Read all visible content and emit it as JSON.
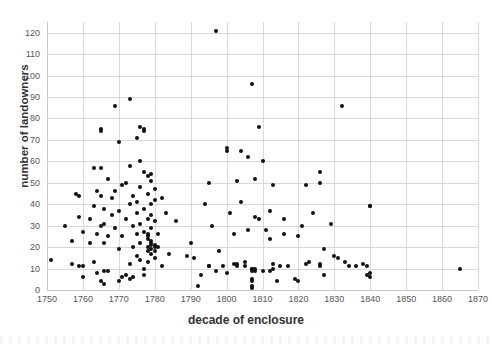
{
  "chart_data": {
    "type": "scatter",
    "title": "",
    "xlabel": "decade of enclosure",
    "ylabel": "number of landowners",
    "xlim": [
      1750,
      1870
    ],
    "ylim": [
      0,
      125
    ],
    "xticks": [
      1750,
      1760,
      1770,
      1780,
      1790,
      1800,
      1810,
      1820,
      1830,
      1840,
      1850,
      1860,
      1870
    ],
    "yticks": [
      0,
      10,
      20,
      30,
      40,
      50,
      60,
      70,
      80,
      90,
      100,
      110,
      120
    ],
    "grid": true,
    "legend": "none",
    "marker": "filled-circle",
    "marker_color": "#111111",
    "grid_color": "#d9d9d9",
    "points": [
      [
        1751,
        14
      ],
      [
        1755,
        30
      ],
      [
        1757,
        23
      ],
      [
        1757,
        12
      ],
      [
        1758,
        45
      ],
      [
        1759,
        44
      ],
      [
        1759,
        34
      ],
      [
        1759,
        11
      ],
      [
        1760,
        6
      ],
      [
        1760,
        27
      ],
      [
        1760,
        11
      ],
      [
        1762,
        33
      ],
      [
        1762,
        22
      ],
      [
        1763,
        57
      ],
      [
        1763,
        13
      ],
      [
        1763,
        39
      ],
      [
        1764,
        26
      ],
      [
        1764,
        8
      ],
      [
        1764,
        46
      ],
      [
        1765,
        74
      ],
      [
        1765,
        75
      ],
      [
        1765,
        44
      ],
      [
        1765,
        30
      ],
      [
        1765,
        57
      ],
      [
        1765,
        4
      ],
      [
        1766,
        3
      ],
      [
        1766,
        38
      ],
      [
        1766,
        9
      ],
      [
        1766,
        31
      ],
      [
        1766,
        22
      ],
      [
        1767,
        9
      ],
      [
        1767,
        25
      ],
      [
        1767,
        52
      ],
      [
        1768,
        35
      ],
      [
        1768,
        43
      ],
      [
        1769,
        29
      ],
      [
        1769,
        46
      ],
      [
        1769,
        86
      ],
      [
        1770,
        69
      ],
      [
        1770,
        4
      ],
      [
        1770,
        19
      ],
      [
        1770,
        37
      ],
      [
        1771,
        6
      ],
      [
        1771,
        49
      ],
      [
        1771,
        25
      ],
      [
        1772,
        50
      ],
      [
        1772,
        33
      ],
      [
        1772,
        7
      ],
      [
        1773,
        89
      ],
      [
        1773,
        58
      ],
      [
        1773,
        40
      ],
      [
        1773,
        12
      ],
      [
        1773,
        5
      ],
      [
        1774,
        30
      ],
      [
        1774,
        44
      ],
      [
        1774,
        6
      ],
      [
        1774,
        20
      ],
      [
        1775,
        71
      ],
      [
        1775,
        41
      ],
      [
        1775,
        26
      ],
      [
        1775,
        36
      ],
      [
        1775,
        16
      ],
      [
        1776,
        76
      ],
      [
        1776,
        60
      ],
      [
        1776,
        48
      ],
      [
        1776,
        22
      ],
      [
        1776,
        14
      ],
      [
        1776,
        31
      ],
      [
        1777,
        74
      ],
      [
        1777,
        75
      ],
      [
        1777,
        55
      ],
      [
        1777,
        38
      ],
      [
        1777,
        27
      ],
      [
        1777,
        10
      ],
      [
        1777,
        7
      ],
      [
        1778,
        53
      ],
      [
        1778,
        45
      ],
      [
        1778,
        33
      ],
      [
        1778,
        24
      ],
      [
        1778,
        25
      ],
      [
        1778,
        26
      ],
      [
        1778,
        20
      ],
      [
        1778,
        18
      ],
      [
        1778,
        13
      ],
      [
        1779,
        54
      ],
      [
        1779,
        51
      ],
      [
        1779,
        40
      ],
      [
        1779,
        35
      ],
      [
        1779,
        23
      ],
      [
        1779,
        21
      ],
      [
        1779,
        22
      ],
      [
        1779,
        19
      ],
      [
        1779,
        17
      ],
      [
        1779,
        29
      ],
      [
        1780,
        47
      ],
      [
        1780,
        42
      ],
      [
        1780,
        32
      ],
      [
        1780,
        21
      ],
      [
        1780,
        20
      ],
      [
        1780,
        18
      ],
      [
        1780,
        15
      ],
      [
        1781,
        26
      ],
      [
        1781,
        20
      ],
      [
        1782,
        11
      ],
      [
        1782,
        43
      ],
      [
        1783,
        36
      ],
      [
        1784,
        17
      ],
      [
        1786,
        32
      ],
      [
        1789,
        16
      ],
      [
        1790,
        22
      ],
      [
        1791,
        15
      ],
      [
        1792,
        2
      ],
      [
        1793,
        7
      ],
      [
        1794,
        40
      ],
      [
        1795,
        11
      ],
      [
        1795,
        11
      ],
      [
        1795,
        50
      ],
      [
        1796,
        30
      ],
      [
        1797,
        121
      ],
      [
        1797,
        9
      ],
      [
        1798,
        18
      ],
      [
        1799,
        11
      ],
      [
        1800,
        66
      ],
      [
        1800,
        65
      ],
      [
        1800,
        8
      ],
      [
        1801,
        36
      ],
      [
        1802,
        12
      ],
      [
        1802,
        26
      ],
      [
        1803,
        11
      ],
      [
        1803,
        12
      ],
      [
        1803,
        51
      ],
      [
        1804,
        65
      ],
      [
        1804,
        41
      ],
      [
        1805,
        13
      ],
      [
        1805,
        11
      ],
      [
        1806,
        62
      ],
      [
        1806,
        28
      ],
      [
        1807,
        96
      ],
      [
        1807,
        10
      ],
      [
        1807,
        9
      ],
      [
        1807,
        5
      ],
      [
        1807,
        4
      ],
      [
        1807,
        2
      ],
      [
        1807,
        1
      ],
      [
        1807,
        10
      ],
      [
        1808,
        52
      ],
      [
        1808,
        9
      ],
      [
        1808,
        10
      ],
      [
        1808,
        34
      ],
      [
        1809,
        76
      ],
      [
        1809,
        33
      ],
      [
        1810,
        60
      ],
      [
        1810,
        9
      ],
      [
        1811,
        28
      ],
      [
        1812,
        24
      ],
      [
        1812,
        37
      ],
      [
        1812,
        9
      ],
      [
        1813,
        49
      ],
      [
        1813,
        12
      ],
      [
        1813,
        10
      ],
      [
        1814,
        4
      ],
      [
        1815,
        11
      ],
      [
        1816,
        33
      ],
      [
        1816,
        26
      ],
      [
        1817,
        11
      ],
      [
        1819,
        5
      ],
      [
        1820,
        4
      ],
      [
        1820,
        25
      ],
      [
        1821,
        30
      ],
      [
        1822,
        49
      ],
      [
        1822,
        12
      ],
      [
        1823,
        13
      ],
      [
        1824,
        36
      ],
      [
        1826,
        55
      ],
      [
        1826,
        50
      ],
      [
        1826,
        12
      ],
      [
        1826,
        11
      ],
      [
        1827,
        7
      ],
      [
        1827,
        19
      ],
      [
        1829,
        31
      ],
      [
        1830,
        16
      ],
      [
        1831,
        15
      ],
      [
        1832,
        86
      ],
      [
        1833,
        13
      ],
      [
        1834,
        11
      ],
      [
        1836,
        11
      ],
      [
        1838,
        12
      ],
      [
        1839,
        11
      ],
      [
        1839,
        7
      ],
      [
        1840,
        39
      ],
      [
        1840,
        39
      ],
      [
        1840,
        6
      ],
      [
        1840,
        8
      ],
      [
        1865,
        10
      ]
    ]
  }
}
